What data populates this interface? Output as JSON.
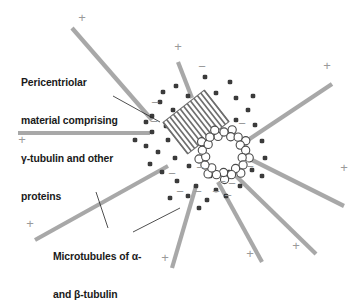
{
  "figure": {
    "background_color": "#ffffff",
    "width": 363,
    "height": 277
  },
  "colors": {
    "microtubule_gray": "#a8a8a8",
    "pcm_dot": "#3b3b3b",
    "centriole_stroke": "#6e6e6e",
    "leader_line": "#222222",
    "text": "#1a1a1a",
    "sign_gray": "#9a9a9a"
  },
  "labels": {
    "pericentriolar": {
      "lines": [
        "Pericentriolar",
        "material comprising",
        "γ-tubulin and other",
        "proteins"
      ],
      "text": "Pericentriolar material comprising γ-tubulin and other proteins"
    },
    "microtubules": {
      "lines": [
        "Microtubules of α-",
        "and β-tubulin"
      ],
      "text": "Microtubules of α- and β-tubulin"
    }
  },
  "structures": {
    "centriole_longitudinal": {
      "name": "hatched centriole (side view)",
      "center": [
        196,
        122
      ],
      "width": 52,
      "height": 40,
      "rotation_deg": -38,
      "hatch_count": 13
    },
    "centriole_cross_section": {
      "name": "centriole ring (cross section)",
      "center": [
        224,
        154
      ],
      "ring_radius": 22,
      "triplet_count": 9,
      "subunit_radius": 4.1
    }
  },
  "pcm_dots": [
    [
      176,
      86
    ],
    [
      205,
      77
    ],
    [
      188,
      96
    ],
    [
      216,
      93
    ],
    [
      160,
      102
    ],
    [
      173,
      110
    ],
    [
      152,
      116
    ],
    [
      236,
      98
    ],
    [
      202,
      107
    ],
    [
      248,
      110
    ],
    [
      166,
      126
    ],
    [
      152,
      132
    ],
    [
      168,
      140
    ],
    [
      255,
      125
    ],
    [
      236,
      120
    ],
    [
      262,
      141
    ],
    [
      146,
      146
    ],
    [
      158,
      152
    ],
    [
      175,
      158
    ],
    [
      189,
      166
    ],
    [
      247,
      152
    ],
    [
      265,
      158
    ],
    [
      150,
      164
    ],
    [
      162,
      172
    ],
    [
      210,
      176
    ],
    [
      229,
      172
    ],
    [
      252,
      170
    ],
    [
      177,
      181
    ],
    [
      196,
      186
    ],
    [
      216,
      190
    ],
    [
      240,
      186
    ],
    [
      262,
      176
    ],
    [
      188,
      196
    ],
    [
      207,
      200
    ],
    [
      226,
      196
    ],
    [
      199,
      208
    ],
    [
      146,
      122
    ],
    [
      163,
      92
    ],
    [
      230,
      82
    ],
    [
      253,
      96
    ],
    [
      135,
      140
    ],
    [
      170,
      198
    ]
  ],
  "microtubules": [
    {
      "id": "mt-upper-left",
      "x1": 152,
      "y1": 120,
      "x2": 72,
      "y2": 28,
      "plus": [
        82,
        22
      ],
      "minus": [
        155,
        107
      ]
    },
    {
      "id": "mt-left-horizontal",
      "x1": 150,
      "y1": 133,
      "x2": 18,
      "y2": 133,
      "plus": [
        22,
        144
      ],
      "minus": [
        154,
        126
      ]
    },
    {
      "id": "mt-top-short",
      "x1": 192,
      "y1": 98,
      "x2": 178,
      "y2": 62,
      "plus": [
        178,
        51
      ],
      "minus": [
        202,
        71
      ]
    },
    {
      "id": "mt-upper-right",
      "x1": 245,
      "y1": 142,
      "x2": 332,
      "y2": 84,
      "plus": [
        327,
        70
      ],
      "minus": [
        242,
        128
      ]
    },
    {
      "id": "mt-right",
      "x1": 252,
      "y1": 160,
      "x2": 344,
      "y2": 206,
      "plus": [
        344,
        172
      ],
      "minus": [
        250,
        171
      ]
    },
    {
      "id": "mt-lower-right-a",
      "x1": 236,
      "y1": 176,
      "x2": 316,
      "y2": 254,
      "plus": [
        296,
        250
      ],
      "minus": [
        232,
        188
      ]
    },
    {
      "id": "mt-lower-right-b",
      "x1": 218,
      "y1": 182,
      "x2": 262,
      "y2": 262,
      "plus": [
        250,
        258
      ],
      "minus": [
        216,
        196
      ]
    },
    {
      "id": "mt-lower-center",
      "x1": 196,
      "y1": 186,
      "x2": 172,
      "y2": 268,
      "plus": [
        165,
        262
      ],
      "minus": [
        198,
        196
      ]
    },
    {
      "id": "mt-lower-left",
      "x1": 168,
      "y1": 166,
      "x2": 35,
      "y2": 240,
      "plus": [
        30,
        228
      ],
      "minus": [
        172,
        178
      ]
    }
  ],
  "signs": {
    "plus_label": "+",
    "minus_label": "−",
    "plus_meaning": "plus end of microtubule",
    "minus_meaning": "minus end of microtubule anchored at centrosome"
  },
  "leader_lines": {
    "pericentriolar": [
      [
        113,
        96
      ],
      [
        160,
        122
      ]
    ],
    "microtubule_a": [
      [
        108,
        228
      ],
      [
        96,
        192
      ]
    ],
    "microtubule_b": [
      [
        133,
        232
      ],
      [
        180,
        208
      ]
    ]
  }
}
